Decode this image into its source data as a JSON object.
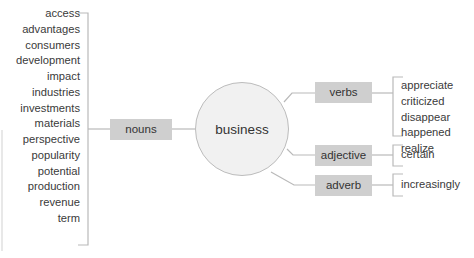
{
  "center": {
    "label": "business"
  },
  "branches": {
    "nouns": {
      "label": "nouns",
      "words": [
        "access",
        "advantages",
        "consumers",
        "development",
        "impact",
        "industries",
        "investments",
        "materials",
        "perspective",
        "popularity",
        "potential",
        "production",
        "revenue",
        "term"
      ]
    },
    "verbs": {
      "label": "verbs",
      "words": [
        "appreciate",
        "criticized",
        "disappear",
        "happened",
        "realize"
      ]
    },
    "adjective": {
      "label": "adjective",
      "words": [
        "certain"
      ]
    },
    "adverb": {
      "label": "adverb",
      "words": [
        "increasingly"
      ]
    }
  },
  "colors": {
    "box_fill": "#cfcfcf",
    "circle_fill": "#f1f1f1",
    "line": "#b9b9b9",
    "text": "#3a3a3a"
  }
}
